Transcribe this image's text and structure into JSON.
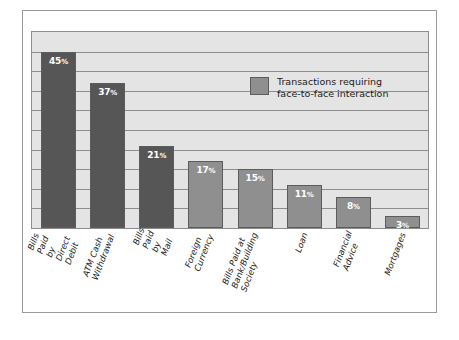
{
  "chart_data": {
    "type": "bar",
    "title": "",
    "subtitle": "",
    "xlabel": "",
    "ylabel": "",
    "ylim": [
      0,
      50
    ],
    "grid": true,
    "gridline_count": 10,
    "legend_position": "inside-top-right",
    "legend": [
      {
        "label": "Transactions requiring\nface-to-face interaction",
        "color": "#8f8f8f"
      }
    ],
    "categories": [
      "Bills Paid by\nDirect Debit",
      "ATM Cash\nWithdrawal",
      "Bills Paid\nby Mail",
      "Foreign\nCurrency",
      "Bills Paid at\nBank/Building\nSociety",
      "Loan",
      "Financial\nAdvice",
      "Mortgages"
    ],
    "values": [
      45,
      37,
      21,
      17,
      15,
      11,
      8,
      3
    ],
    "value_labels": [
      "45%",
      "37%",
      "21%",
      "17%",
      "15%",
      "11%",
      "8%",
      "3%"
    ],
    "bar_colors": [
      "#565656",
      "#565656",
      "#565656",
      "#8f8f8f",
      "#8f8f8f",
      "#8f8f8f",
      "#8f8f8f",
      "#8f8f8f"
    ],
    "colors": {
      "plot_background": "#e4e4e4",
      "gridline": "#8d8d8d",
      "bar_dark": "#565656",
      "bar_light": "#8f8f8f",
      "bar_outline": "#5c5c5c",
      "frame": "#9a9a9a",
      "value_text": "#ffffff",
      "label_text": "#1b1b1b"
    }
  }
}
